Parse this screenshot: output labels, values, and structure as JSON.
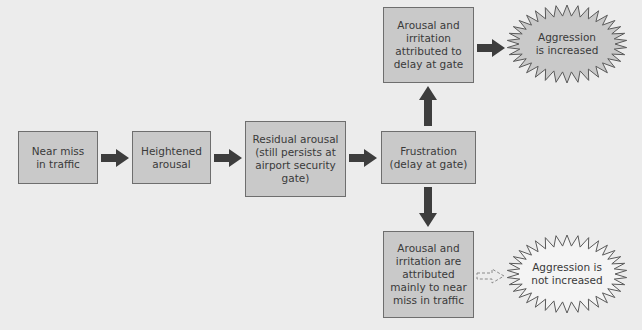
{
  "diagram": {
    "nodes": [
      {
        "id": "near-miss",
        "label": "Near miss\nin traffic"
      },
      {
        "id": "heightened",
        "label": "Heightened\narousal"
      },
      {
        "id": "residual",
        "label": "Residual arousal\n(still persists at\nairport security\ngate)"
      },
      {
        "id": "frustration",
        "label": "Frustration\n(delay at gate)"
      },
      {
        "id": "attrib-gate",
        "label": "Arousal and\nirritation\nattributed to\ndelay at gate"
      },
      {
        "id": "attrib-traffic",
        "label": "Arousal and\nirritation are\nattributed\nmainly to near\nmiss in traffic"
      }
    ],
    "outcomes": [
      {
        "id": "increased",
        "label": "Aggression\nis increased",
        "fill": "#c9c9c9"
      },
      {
        "id": "not-increased",
        "label": "Aggression is\nnot increased",
        "fill": "#f4f4f4"
      }
    ],
    "edges": [
      {
        "from": "near-miss",
        "to": "heightened",
        "style": "solid"
      },
      {
        "from": "heightened",
        "to": "residual",
        "style": "solid"
      },
      {
        "from": "residual",
        "to": "frustration",
        "style": "solid"
      },
      {
        "from": "frustration",
        "to": "attrib-gate",
        "style": "solid"
      },
      {
        "from": "frustration",
        "to": "attrib-traffic",
        "style": "solid"
      },
      {
        "from": "attrib-gate",
        "to": "increased",
        "style": "solid"
      },
      {
        "from": "attrib-traffic",
        "to": "not-increased",
        "style": "dashed"
      }
    ],
    "colors": {
      "background": "#ececec",
      "box_fill": "#c9c9c9",
      "box_border": "#6e6e6e",
      "arrow": "#3d3d3d",
      "text": "#3a3a3a"
    }
  }
}
